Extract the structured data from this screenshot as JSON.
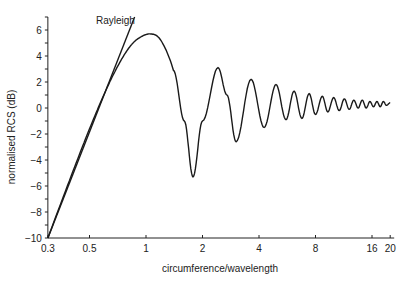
{
  "chart_data": {
    "type": "line",
    "title": "",
    "xlabel": "circumference/wavelength",
    "ylabel": "normalised RCS (dB)",
    "xscale": "log",
    "xlim": [
      0.3,
      20
    ],
    "ylim": [
      -10,
      7
    ],
    "grid": false,
    "legend": null,
    "x_ticks": [
      {
        "value": 0.3,
        "label": "0.3"
      },
      {
        "value": 0.5,
        "label": "0.5"
      },
      {
        "value": 1,
        "label": "1"
      },
      {
        "value": 2,
        "label": "2"
      },
      {
        "value": 4,
        "label": "4"
      },
      {
        "value": 8,
        "label": "8"
      },
      {
        "value": 16,
        "label": "16"
      },
      {
        "value": 20,
        "label": "20"
      }
    ],
    "y_ticks": [
      {
        "value": 6,
        "label": "6"
      },
      {
        "value": 4,
        "label": "4"
      },
      {
        "value": 2,
        "label": "2"
      },
      {
        "value": 0,
        "label": "0"
      },
      {
        "value": -2,
        "label": "−2"
      },
      {
        "value": -4,
        "label": "−4"
      },
      {
        "value": -6,
        "label": "−6"
      },
      {
        "value": -8,
        "label": "−8"
      },
      {
        "value": -10,
        "label": "−10"
      }
    ],
    "annotations": [
      {
        "text": "Rayleigh",
        "target": "rayleigh-line"
      }
    ],
    "series": [
      {
        "name": "Rayleigh",
        "style": "straight line",
        "x": [
          0.3,
          0.87
        ],
        "y": [
          -10,
          7
        ]
      },
      {
        "name": "Sphere RCS (exact)",
        "style": "solid",
        "x": [
          0.3,
          0.4,
          0.5,
          0.6,
          0.7,
          0.8,
          0.9,
          1.05,
          1.2,
          1.4,
          1.6,
          1.78,
          2.0,
          2.42,
          2.7,
          3.02,
          3.63,
          4.26,
          4.93,
          5.57,
          6.15,
          6.77,
          7.4,
          8.0,
          8.7,
          9.3,
          10.0,
          10.7,
          11.4,
          12.1,
          12.8,
          13.5,
          14.2,
          14.9,
          15.6,
          16.3,
          17.0,
          17.7,
          18.4,
          19.1,
          20.0
        ],
        "y": [
          -10,
          -5.2,
          -1.6,
          1.1,
          3.1,
          4.5,
          5.3,
          5.7,
          5.2,
          2.9,
          -1.0,
          -5.3,
          -1.0,
          3.1,
          1.0,
          -2.6,
          2.2,
          -1.5,
          1.8,
          -0.9,
          1.3,
          -0.8,
          1.1,
          -0.5,
          0.9,
          -0.3,
          0.8,
          -0.2,
          0.7,
          -0.1,
          0.6,
          0.0,
          0.6,
          0.0,
          0.5,
          0.1,
          0.5,
          0.1,
          0.5,
          0.2,
          0.4
        ]
      }
    ]
  }
}
